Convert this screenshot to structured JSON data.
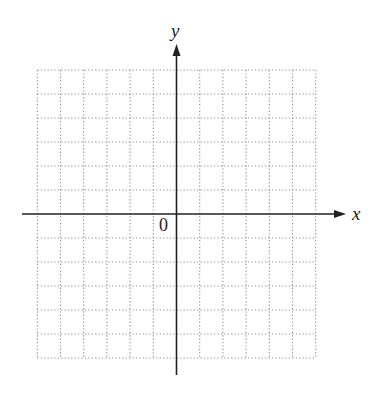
{
  "diagram": {
    "type": "coordinate-plane",
    "axes": {
      "x_label": "x",
      "y_label": "y",
      "origin_label": "0",
      "color": "#222222"
    },
    "grid": {
      "columns_left": 6,
      "columns_right": 6,
      "rows_above": 6,
      "rows_below": 6,
      "style": "dotted",
      "color": "#8a8a8a"
    }
  }
}
